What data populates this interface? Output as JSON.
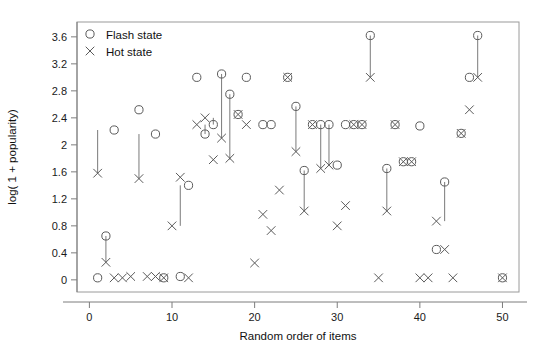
{
  "chart_data": {
    "type": "scatter",
    "title": "",
    "xlabel": "Random order of items",
    "ylabel": "log( 1 + popularity)",
    "xlim": [
      -1.5,
      52
    ],
    "ylim": [
      -0.18,
      3.82
    ],
    "xticks": [
      0,
      10,
      20,
      30,
      40,
      50
    ],
    "xtick_labels": [
      "0",
      "10",
      "20",
      "30",
      "40",
      "50"
    ],
    "yticks": [
      0,
      0.4,
      0.8,
      1.2,
      1.6,
      2,
      2.4,
      2.8,
      3.2,
      3.6
    ],
    "ytick_labels": [
      "0",
      "0.4",
      "0.8",
      "1.2",
      "1.6",
      "2",
      "2.4",
      "2.8",
      "3.2",
      "3.6"
    ],
    "grid": false,
    "legend_position": "top-left",
    "series": [
      {
        "name": "Flash state",
        "marker": "circle",
        "color": "#5a5a5a",
        "x": [
          1,
          2,
          3,
          6,
          8,
          9,
          11,
          12,
          13,
          14,
          15,
          16,
          17,
          18,
          19,
          21,
          22,
          24,
          25,
          26,
          27,
          28,
          29,
          30,
          31,
          32,
          33,
          34,
          36,
          37,
          38,
          39,
          40,
          42,
          43,
          45,
          46,
          47,
          50
        ],
        "y": [
          0.03,
          0.65,
          2.22,
          2.52,
          2.16,
          0.03,
          0.05,
          1.4,
          3.0,
          2.16,
          2.3,
          3.05,
          2.75,
          2.45,
          3.0,
          2.3,
          2.3,
          3.0,
          2.57,
          1.62,
          2.3,
          2.3,
          2.3,
          1.7,
          2.3,
          2.3,
          2.3,
          3.62,
          1.65,
          2.3,
          1.75,
          1.75,
          2.28,
          0.45,
          1.45,
          2.17,
          3.0,
          3.62,
          0.03
        ]
      },
      {
        "name": "Hot state",
        "marker": "cross",
        "color": "#5a5a5a",
        "x": [
          1,
          2,
          3,
          4,
          5,
          6,
          7,
          8,
          9,
          10,
          11,
          12,
          13,
          14,
          15,
          16,
          17,
          18,
          19,
          20,
          21,
          22,
          23,
          24,
          25,
          26,
          27,
          28,
          29,
          30,
          31,
          32,
          33,
          34,
          35,
          36,
          37,
          38,
          39,
          40,
          41,
          42,
          43,
          44,
          45,
          46,
          47,
          50
        ],
        "y": [
          1.58,
          0.26,
          0.03,
          0.03,
          0.05,
          1.5,
          0.05,
          0.05,
          0.03,
          0.8,
          1.52,
          0.03,
          2.3,
          2.4,
          1.78,
          2.1,
          1.8,
          2.45,
          2.3,
          0.25,
          0.97,
          0.73,
          1.33,
          3.0,
          1.9,
          1.02,
          2.3,
          1.65,
          1.7,
          0.8,
          1.1,
          2.3,
          2.3,
          3.0,
          0.03,
          1.02,
          2.3,
          1.75,
          1.75,
          0.03,
          0.03,
          0.87,
          0.45,
          0.03,
          2.17,
          2.52,
          3.0,
          0.03
        ]
      }
    ],
    "pairs": [
      {
        "x": 1,
        "flash": 2.22,
        "hot": 1.58
      },
      {
        "x": 2,
        "flash": 0.65,
        "hot": 0.26
      },
      {
        "x": 3,
        "flash": 2.52,
        "hot": 2.52
      },
      {
        "x": 6,
        "flash": 2.16,
        "hot": 1.5
      },
      {
        "x": 11,
        "flash": 1.4,
        "hot": 0.8
      },
      {
        "x": 12,
        "flash": 1.52,
        "hot": 1.52
      },
      {
        "x": 13,
        "flash": 3.0,
        "hot": 3.0
      },
      {
        "x": 14,
        "flash": 2.16,
        "hot": 2.3
      },
      {
        "x": 15,
        "flash": 2.3,
        "hot": 2.4
      },
      {
        "x": 16,
        "flash": 3.05,
        "hot": 2.1
      },
      {
        "x": 17,
        "flash": 2.75,
        "hot": 1.78
      },
      {
        "x": 18,
        "flash": 2.45,
        "hot": 2.45
      },
      {
        "x": 19,
        "flash": 3.0,
        "hot": 3.0
      },
      {
        "x": 24,
        "flash": 3.0,
        "hot": 3.0
      },
      {
        "x": 25,
        "flash": 2.57,
        "hot": 1.9
      },
      {
        "x": 26,
        "flash": 1.62,
        "hot": 1.02
      },
      {
        "x": 28,
        "flash": 2.3,
        "hot": 1.65
      },
      {
        "x": 29,
        "flash": 2.3,
        "hot": 1.7
      },
      {
        "x": 34,
        "flash": 3.62,
        "hot": 3.0
      },
      {
        "x": 36,
        "flash": 1.65,
        "hot": 1.02
      },
      {
        "x": 42,
        "flash": 0.45,
        "hot": 0.45
      },
      {
        "x": 43,
        "flash": 1.45,
        "hot": 0.87
      },
      {
        "x": 47,
        "flash": 3.62,
        "hot": 3.0
      }
    ],
    "legend": [
      {
        "label": "Flash state",
        "marker": "circle"
      },
      {
        "label": "Hot state",
        "marker": "cross"
      }
    ]
  },
  "figure": {
    "xlabel": "Random order of items",
    "ylabel": "log( 1 + popularity)"
  }
}
